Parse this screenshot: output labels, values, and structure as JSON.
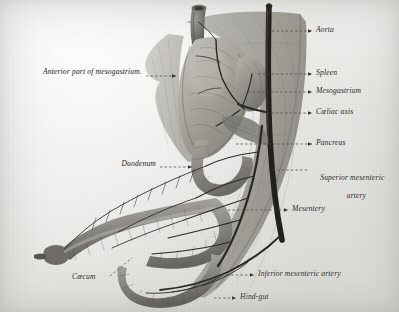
{
  "figure": {
    "kind": "anatomical-illustration",
    "media": "halftone photographic plate on off-white paper",
    "palette": {
      "paper": "#ebebe9",
      "paper_light": "#f2f2f0",
      "paper_dark": "#e3e3df",
      "tissue_light": "#b9b7b1",
      "tissue_mid": "#8f8d87",
      "tissue_dark": "#66645f",
      "vessel": "#2a2925",
      "aorta": "#231f1c",
      "label_ink": "#2b2a27",
      "leader": "#4a4845"
    }
  },
  "labels": {
    "right": [
      {
        "id": "aorta",
        "text": "Aorta",
        "x": 316,
        "y": 27,
        "leader_from_x": 272,
        "leader_to_x": 312,
        "leader_y": 31,
        "arrow": true
      },
      {
        "id": "spleen",
        "text": "Spleen",
        "x": 316,
        "y": 70,
        "leader_from_x": 258,
        "leader_to_x": 312,
        "leader_y": 74,
        "arrow": true
      },
      {
        "id": "mesogastrium",
        "text": "Mesogastrium",
        "x": 316,
        "y": 88,
        "leader_from_x": 248,
        "leader_to_x": 312,
        "leader_y": 92,
        "arrow": true
      },
      {
        "id": "coeliac-axis",
        "text": "Cœliac axis",
        "x": 316,
        "y": 109,
        "leader_from_x": 262,
        "leader_to_x": 312,
        "leader_y": 113,
        "arrow": true
      },
      {
        "id": "pancreas",
        "text": "Pancreas",
        "x": 316,
        "y": 140,
        "leader_from_x": 236,
        "leader_to_x": 312,
        "leader_y": 144,
        "arrow": true
      },
      {
        "id": "superior-mesenteric-artery",
        "text": "Superior mesenteric",
        "text2": "artery",
        "x": 312,
        "y": 166,
        "leader_from_x": 268,
        "leader_to_x": 308,
        "leader_y": 170,
        "arrow": false
      },
      {
        "id": "mesentery",
        "text": "Mesentery",
        "x": 292,
        "y": 206,
        "leader_from_x": 228,
        "leader_to_x": 288,
        "leader_y": 210,
        "arrow": true
      },
      {
        "id": "inferior-mesenteric-artery",
        "text": "Inferior mesenteric artery",
        "x": 258,
        "y": 271,
        "leader_from_x": 222,
        "leader_to_x": 254,
        "leader_y": 275,
        "arrow": true
      },
      {
        "id": "hind-gut",
        "text": "Hind-gut",
        "x": 240,
        "y": 294,
        "leader_from_x": 214,
        "leader_to_x": 236,
        "leader_y": 298,
        "arrow": true
      }
    ],
    "left": [
      {
        "id": "anterior-part-of-mesogastrium",
        "text": "Anterior part of mesogastrium.",
        "x": 18,
        "y": 71,
        "leader_from_x": 146,
        "leader_to_x": 176,
        "leader_y": 76,
        "arrow": true
      },
      {
        "id": "duodenum",
        "text": "Duodenum",
        "x": 114,
        "y": 163,
        "leader_from_x": 160,
        "leader_to_x": 192,
        "leader_y": 167,
        "arrow": true
      }
    ],
    "angled": [
      {
        "id": "caecum",
        "text": "Cæcum",
        "x": 72,
        "y": 277,
        "leader_x1": 110,
        "leader_y1": 276,
        "leader_x2": 132,
        "leader_y2": 258
      }
    ]
  },
  "structures": [
    {
      "id": "oesophagus",
      "name": "oesophagus",
      "note": "hollow tube entering stomach at top left"
    },
    {
      "id": "stomach",
      "name": "stomach",
      "note": "large pale mass, centre upper"
    },
    {
      "id": "spleen-body",
      "name": "spleen",
      "note": "rounded organ right of stomach"
    },
    {
      "id": "aorta-trunk",
      "name": "aorta",
      "note": "dark vertical vessel at right"
    },
    {
      "id": "coeliac-trunk",
      "name": "coeliac axis",
      "note": "branch from aorta to stomach and spleen"
    },
    {
      "id": "pancreas-body",
      "name": "pancreas",
      "note": "behind stomach, near duodenal curve"
    },
    {
      "id": "duodenum-loop",
      "name": "duodenum",
      "note": "C-shaped loop descending from stomach"
    },
    {
      "id": "mesentery-sheet",
      "name": "mesentery",
      "note": "broad translucent fan to the right"
    },
    {
      "id": "small-intestine",
      "name": "small intestine loop",
      "note": "long segmented loop running to caecum"
    },
    {
      "id": "caecum-tip",
      "name": "caecum",
      "note": "blind pouch at left extremity"
    },
    {
      "id": "hind-gut-limb",
      "name": "hind-gut",
      "note": "lower limb curving below the loop"
    },
    {
      "id": "sma",
      "name": "superior mesenteric artery",
      "note": "long artery in mesentery"
    },
    {
      "id": "ima",
      "name": "inferior mesenteric artery",
      "note": "lower artery to hind-gut"
    }
  ]
}
